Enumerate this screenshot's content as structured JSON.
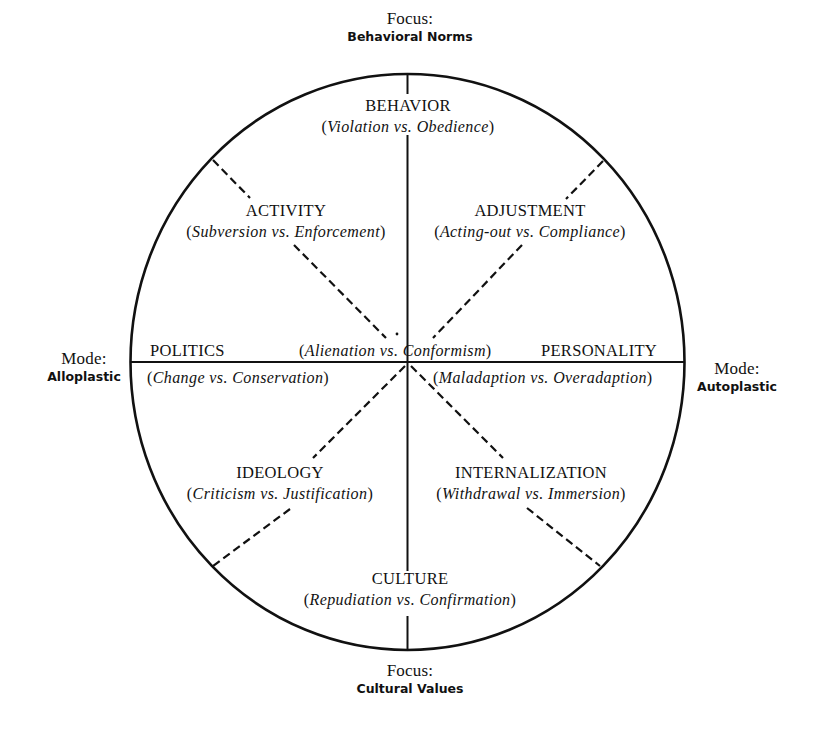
{
  "figure": {
    "colors": {
      "background": "#ffffff",
      "ink": "#111111"
    },
    "axes": {
      "top": {
        "label": "Focus:",
        "value": "Behavioral Norms"
      },
      "bottom": {
        "label": "Focus:",
        "value": "Cultural Values"
      },
      "left": {
        "label": "Mode:",
        "value": "Alloplastic"
      },
      "right": {
        "label": "Mode:",
        "value": "Autoplastic"
      }
    },
    "center": {
      "left_text": "(Alienation vs.",
      "right_text": "Conformism)",
      "full_text": "(Alienation vs. Conformism)"
    },
    "sectors": [
      {
        "id": "behavior",
        "title": "BEHAVIOR",
        "open": "(",
        "a": "Violation",
        "vs": "vs.",
        "b": "Obedience",
        "close": ")"
      },
      {
        "id": "activity",
        "title": "ACTIVITY",
        "open": "(",
        "a": "Subversion",
        "vs": "vs.",
        "b": "Enforcement",
        "close": ")"
      },
      {
        "id": "adjustment",
        "title": "ADJUSTMENT",
        "open": "(",
        "a": "Acting-out",
        "vs": "vs.",
        "b": "Compliance",
        "close": ")"
      },
      {
        "id": "politics",
        "title": "POLITICS",
        "open": "(",
        "a": "Change",
        "vs": "vs.",
        "b": "Conservation",
        "close": ")"
      },
      {
        "id": "personality",
        "title": "PERSONALITY",
        "open": "(",
        "a": "Maladaption",
        "vs": "vs.",
        "b": "Overadaption",
        "close": ")"
      },
      {
        "id": "ideology",
        "title": "IDEOLOGY",
        "open": "(",
        "a": "Criticism",
        "vs": "vs.",
        "b": "Justification",
        "close": ")"
      },
      {
        "id": "internalization",
        "title": "INTERNALIZATION",
        "open": "(",
        "a": "Withdrawal",
        "vs": "vs.",
        "b": "Immersion",
        "close": ")"
      },
      {
        "id": "culture",
        "title": "CULTURE",
        "open": "(",
        "a": "Repudiation",
        "vs": "vs.",
        "b": "Confirmation",
        "close": ")"
      }
    ]
  }
}
